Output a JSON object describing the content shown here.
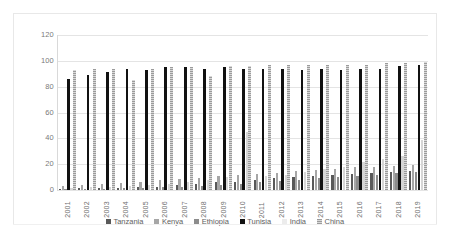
{
  "chart_data": {
    "type": "bar",
    "title": "",
    "xlabel": "",
    "ylabel": "",
    "ylim": [
      0,
      120
    ],
    "yticks": [
      0,
      20,
      40,
      60,
      80,
      100,
      120
    ],
    "grid": true,
    "legend_position": "bottom",
    "categories": [
      "2001",
      "2002",
      "2003",
      "2004",
      "2005",
      "2006",
      "2007",
      "2008",
      "2009",
      "2010",
      "2011",
      "2012",
      "2013",
      "2014",
      "2015",
      "2016",
      "2017",
      "2018",
      "2019"
    ],
    "series": [
      {
        "name": "Tanzania",
        "color": "#595959",
        "values": [
          1.0,
          1.2,
          1.5,
          1.8,
          2.2,
          2.6,
          3.5,
          4.5,
          6.0,
          6.5,
          7.5,
          9.0,
          10.0,
          10.5,
          11.5,
          12.5,
          13.5,
          14.0,
          15.0
        ]
      },
      {
        "name": "Kenya",
        "color": "#a6a6a6",
        "values": [
          3.0,
          3.5,
          4.5,
          5.5,
          6.5,
          7.5,
          8.5,
          9.5,
          10.5,
          11.5,
          12.5,
          13.5,
          14.5,
          15.5,
          16.5,
          17.5,
          18.0,
          18.5,
          19.0
        ]
      },
      {
        "name": "Ethiopia",
        "color": "#8c8c8c",
        "values": [
          0.5,
          0.8,
          1.0,
          1.3,
          1.6,
          2.0,
          2.5,
          3.0,
          4.0,
          5.0,
          6.0,
          7.0,
          8.0,
          9.0,
          10.0,
          11.0,
          12.0,
          13.0,
          14.0
        ]
      },
      {
        "name": "Tunisia",
        "color": "#111111",
        "values": [
          86,
          89,
          91,
          94,
          93,
          95,
          95,
          94,
          95,
          94,
          94,
          94,
          93,
          94,
          93,
          94,
          94,
          96,
          97
        ]
      },
      {
        "name": "India",
        "color": "#ececec",
        "values": [
          1.5,
          2.0,
          2.5,
          3.0,
          4.0,
          5.0,
          6.5,
          8.0,
          10.0,
          45.0,
          11.0,
          12.0,
          14.0,
          16.0,
          18.0,
          22.0,
          24.0,
          26.0,
          39.0
        ]
      },
      {
        "name": "China",
        "color": "#9b9b9b",
        "values": [
          93,
          94,
          94,
          85,
          94,
          95,
          95,
          88,
          96,
          96,
          97,
          97,
          97,
          97,
          97,
          97,
          98,
          98,
          99
        ]
      }
    ]
  },
  "legend": {
    "items": [
      {
        "label": "Tanzania"
      },
      {
        "label": "Kenya"
      },
      {
        "label": "Ethiopia"
      },
      {
        "label": "Tunisia"
      },
      {
        "label": "India"
      },
      {
        "label": "China"
      }
    ]
  }
}
